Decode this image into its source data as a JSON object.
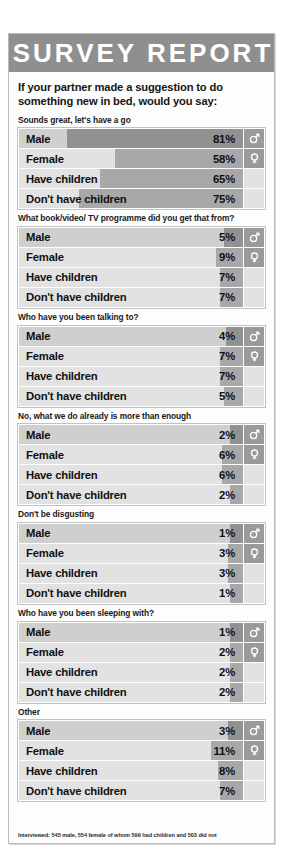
{
  "masthead": {
    "title": "SURVEY REPORT"
  },
  "intro": {
    "question": "If your partner made a suggestion to do something new in bed, would you say:"
  },
  "icons": {
    "male": "male-symbol-icon",
    "female": "female-symbol-icon"
  },
  "credit": {
    "text": "Interviewed: 545 male, 554 female of whom 599 had children and 503 did not"
  },
  "chart_data": {
    "type": "bar",
    "title": "SURVEY REPORT",
    "subtitle": "If your partner made a suggestion to do something new in bed, would you say:",
    "xlabel": "",
    "ylabel": "",
    "xlim": [
      0,
      100
    ],
    "unit": "%",
    "grid": false,
    "legend": "none",
    "categories": [
      "Male",
      "Female",
      "Have children",
      "Don't have children"
    ],
    "note": "Interviewed: 545 male, 554 female of whom 599 had children and 503 did not",
    "groups": [
      {
        "label": "Sounds great, let's have a go",
        "values": [
          81,
          58,
          65,
          75
        ]
      },
      {
        "label": "What book/video/ TV programme did you get that from?",
        "values": [
          5,
          9,
          7,
          7
        ]
      },
      {
        "label": "Who have you been talking to?",
        "values": [
          4,
          7,
          7,
          5
        ]
      },
      {
        "label": "No, what we do already is more than enough",
        "values": [
          2,
          6,
          6,
          2
        ]
      },
      {
        "label": "Don't be disgusting",
        "values": [
          1,
          3,
          3,
          1
        ]
      },
      {
        "label": "Who have you been sleeping with?",
        "values": [
          1,
          2,
          2,
          2
        ]
      },
      {
        "label": "Other",
        "values": [
          3,
          11,
          8,
          7
        ]
      }
    ]
  },
  "blocks": [
    {
      "title": "Sounds great, let's have a go",
      "rows": [
        {
          "label": "Male",
          "value": "81%",
          "pct": 81
        },
        {
          "label": "Female",
          "value": "58%",
          "pct": 58
        },
        {
          "label": "Have children",
          "value": "65%",
          "pct": 65
        },
        {
          "label": "Don't have children",
          "value": "75%",
          "pct": 75
        }
      ]
    },
    {
      "title": "What book/video/ TV programme did you get that from?",
      "rows": [
        {
          "label": "Male",
          "value": "5%",
          "pct": 5
        },
        {
          "label": "Female",
          "value": "9%",
          "pct": 9
        },
        {
          "label": "Have children",
          "value": "7%",
          "pct": 7
        },
        {
          "label": "Don't have children",
          "value": "7%",
          "pct": 7
        }
      ]
    },
    {
      "title": "Who have you been talking to?",
      "rows": [
        {
          "label": "Male",
          "value": "4%",
          "pct": 4
        },
        {
          "label": "Female",
          "value": "7%",
          "pct": 7
        },
        {
          "label": "Have children",
          "value": "7%",
          "pct": 7
        },
        {
          "label": "Don't have children",
          "value": "5%",
          "pct": 5
        }
      ]
    },
    {
      "title": "No, what we do already is more than enough",
      "rows": [
        {
          "label": "Male",
          "value": "2%",
          "pct": 2
        },
        {
          "label": "Female",
          "value": "6%",
          "pct": 6
        },
        {
          "label": "Have children",
          "value": "6%",
          "pct": 6
        },
        {
          "label": "Don't have children",
          "value": "2%",
          "pct": 2
        }
      ]
    },
    {
      "title": "Don't be disgusting",
      "rows": [
        {
          "label": "Male",
          "value": "1%",
          "pct": 1
        },
        {
          "label": "Female",
          "value": "3%",
          "pct": 3
        },
        {
          "label": "Have children",
          "value": "3%",
          "pct": 3
        },
        {
          "label": "Don't have children",
          "value": "1%",
          "pct": 1
        }
      ]
    },
    {
      "title": "Who have you been sleeping with?",
      "rows": [
        {
          "label": "Male",
          "value": "1%",
          "pct": 1
        },
        {
          "label": "Female",
          "value": "2%",
          "pct": 2
        },
        {
          "label": "Have children",
          "value": "2%",
          "pct": 2
        },
        {
          "label": "Don't have children",
          "value": "2%",
          "pct": 2
        }
      ]
    },
    {
      "title": "Other",
      "rows": [
        {
          "label": "Male",
          "value": "3%",
          "pct": 3
        },
        {
          "label": "Female",
          "value": "11%",
          "pct": 11
        },
        {
          "label": "Have children",
          "value": "8%",
          "pct": 8
        },
        {
          "label": "Don't have children",
          "value": "7%",
          "pct": 7
        }
      ]
    }
  ]
}
